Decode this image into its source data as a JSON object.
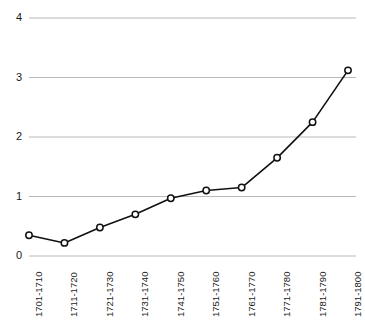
{
  "chart_data": {
    "type": "line",
    "title": "",
    "subtitle": "",
    "xlabel": "",
    "ylabel": "",
    "categories": [
      "1701-1710",
      "1711-1720",
      "1721-1730",
      "1731-1740",
      "1741-1750",
      "1751-1760",
      "1761-1770",
      "1771-1780",
      "1781-1790",
      "1791-1800"
    ],
    "values": [
      0.35,
      0.22,
      0.48,
      0.7,
      0.97,
      1.1,
      1.15,
      1.65,
      2.25,
      3.12
    ],
    "series": [
      {
        "name": "",
        "values": [
          0.35,
          0.22,
          0.48,
          0.7,
          0.97,
          1.1,
          1.15,
          1.65,
          2.25,
          3.12
        ]
      }
    ],
    "ylim": [
      0,
      4
    ],
    "yticks": [
      0,
      1,
      2,
      3,
      4
    ],
    "ytick_labels": [
      "0",
      "1",
      "2",
      "3",
      "4"
    ],
    "grid": true,
    "grid_axis": "y",
    "legend": "none",
    "marker": "circle-open",
    "line_color": "#111111",
    "marker_fill": "#ffffff",
    "marker_stroke": "#111111",
    "grid_color": "#b8b8b8",
    "text_color": "#1a1a1a"
  }
}
